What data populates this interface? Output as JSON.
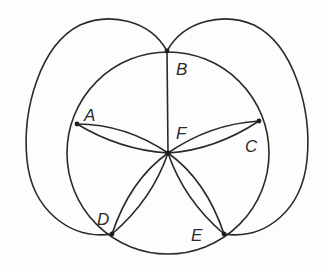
{
  "diagram": {
    "type": "planar graph drawing",
    "vertices": [
      {
        "id": "A",
        "label": "A",
        "x": 77,
        "y": 124
      },
      {
        "id": "B",
        "label": "B",
        "x": 167,
        "y": 51
      },
      {
        "id": "C",
        "label": "C",
        "x": 259,
        "y": 121
      },
      {
        "id": "D",
        "label": "D",
        "x": 112,
        "y": 234
      },
      {
        "id": "E",
        "label": "E",
        "x": 224,
        "y": 234
      },
      {
        "id": "F",
        "label": "F",
        "x": 168,
        "y": 153
      }
    ],
    "labels": {
      "A": "A",
      "B": "B",
      "C": "C",
      "D": "D",
      "E": "E",
      "F": "F"
    },
    "circle": {
      "cx": 168,
      "cy": 153,
      "r": 101
    },
    "edges": [
      {
        "from": "B",
        "to": "F",
        "style": "straight"
      },
      {
        "from": "A",
        "to": "F",
        "style": "double-lens"
      },
      {
        "from": "C",
        "to": "F",
        "style": "double-lens"
      },
      {
        "from": "D",
        "to": "F",
        "style": "double-lens"
      },
      {
        "from": "E",
        "to": "F",
        "style": "double-lens"
      },
      {
        "from": "B",
        "to": "D",
        "style": "outer-loop-left"
      },
      {
        "from": "B",
        "to": "E",
        "style": "outer-loop-right"
      }
    ],
    "colors": {
      "stroke": "#2a2a2a",
      "background": "#fdfdfd"
    }
  }
}
